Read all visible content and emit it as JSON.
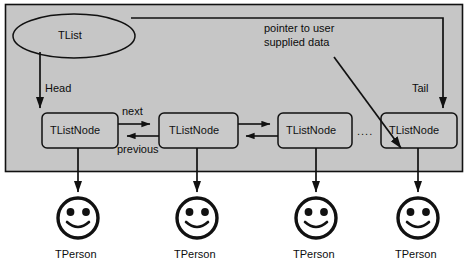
{
  "diagram": {
    "container": {
      "name": "list-container-box",
      "fill": "#c6c6c6",
      "stroke": "#111111"
    },
    "owner": {
      "label": "TList",
      "shape": "ellipse"
    },
    "pointers": {
      "head": "Head",
      "tail": "Tail",
      "next": "next",
      "previous": "previous",
      "ellipsis": "...."
    },
    "annotation": {
      "line1": "pointer to user",
      "line2": "supplied data"
    },
    "nodes": [
      {
        "label": "TListNode"
      },
      {
        "label": "TListNode"
      },
      {
        "label": "TListNode"
      },
      {
        "label": "TListNode"
      }
    ],
    "data_objects": [
      {
        "label": "TPerson",
        "icon": "smiley-face-icon"
      },
      {
        "label": "TPerson",
        "icon": "smiley-face-icon"
      },
      {
        "label": "TPerson",
        "icon": "smiley-face-icon"
      },
      {
        "label": "TPerson",
        "icon": "smiley-face-icon"
      }
    ],
    "colors": {
      "panel": "#c6c6c6",
      "node_fill": "#c9c9c9",
      "ink": "#111111",
      "page": "#ffffff"
    }
  }
}
